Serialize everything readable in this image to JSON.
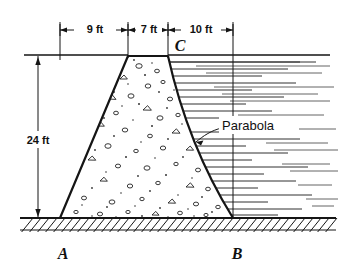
{
  "figure": {
    "labels": {
      "dim_top_1": "9 ft",
      "dim_top_2": "7 ft",
      "dim_top_3": "10 ft",
      "dim_height": "24 ft",
      "point_a": "A",
      "point_b": "B",
      "point_c": "C",
      "curve_note": "Parabola"
    },
    "colors": {
      "ink": "#151515",
      "background": "#ffffff",
      "water_hatch": "#303030"
    }
  },
  "geometry": {
    "units": "ft",
    "top_segments": [
      9,
      7,
      10
    ],
    "total_top_width": 26,
    "height": 24,
    "points": {
      "A": {
        "label": "A",
        "role": "dam-heel-base-left"
      },
      "B": {
        "label": "B",
        "role": "dam-toe-base-right"
      },
      "C": {
        "label": "C",
        "role": "dam-crest-right-water-surface"
      }
    },
    "faces": {
      "upstream": "straight-inclined",
      "downstream": "parabolic"
    }
  },
  "pixel_layout": {
    "ground_y": 218,
    "crest_y": 56,
    "water_surface_y": 55,
    "tick_x": [
      60,
      128,
      168,
      233
    ],
    "dim_line_y": 30,
    "vertical_dim_x": 38,
    "base_left_x": 60,
    "base_right_x": 233,
    "crest_left_x": 128,
    "crest_right_x": 168
  }
}
